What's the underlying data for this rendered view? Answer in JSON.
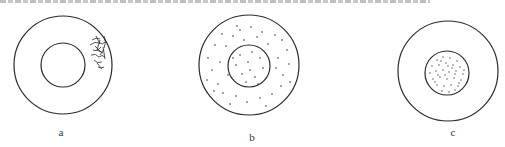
{
  "figure": {
    "panels": [
      {
        "id": "a",
        "label": "a",
        "description": "Two concentric circles; irregular lesion/hatched region on the right edge of the outer ring"
      },
      {
        "id": "b",
        "label": "b",
        "description": "Two concentric circles; dots scattered throughout both the ring and the inner circle"
      },
      {
        "id": "c",
        "label": "c",
        "description": "Two concentric circles; dense dots only within the inner circle"
      }
    ],
    "colors": {
      "line": "#2a2a2a",
      "dot": "#333333",
      "background": "#ffffff"
    }
  }
}
